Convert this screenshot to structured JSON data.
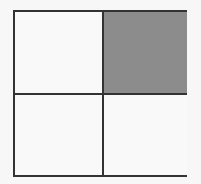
{
  "diagram": {
    "type": "grid",
    "rows": 2,
    "cols": 2,
    "cells": [
      {
        "row": 0,
        "col": 0,
        "shaded": false,
        "color": "#f9f9f9"
      },
      {
        "row": 0,
        "col": 1,
        "shaded": true,
        "color": "#8c8c8c"
      },
      {
        "row": 1,
        "col": 0,
        "shaded": false,
        "color": "#f9f9f9"
      },
      {
        "row": 1,
        "col": 1,
        "shaded": false,
        "color": "#f9f9f9"
      }
    ],
    "line_color": "#333333"
  }
}
